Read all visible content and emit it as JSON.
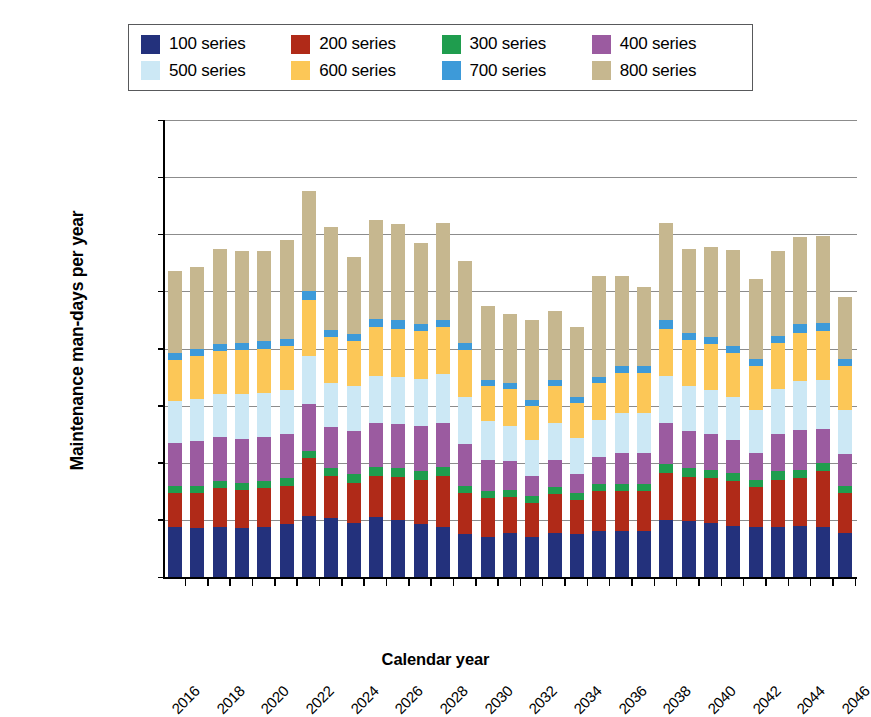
{
  "chart_data": {
    "type": "bar",
    "subtype": "stacked-vertical",
    "title": "",
    "xlabel": "Calendar year",
    "ylabel": "Maintenance man-days per year",
    "ylim": [
      0,
      1600000
    ],
    "ytick_step": 200000,
    "ytick_labels": [
      "1,600,000",
      "1,400,000",
      "1,200,000",
      "1,000,000",
      "800,000",
      "600,000",
      "400,000",
      "200,000",
      "0"
    ],
    "ytick_values": [
      1600000,
      1400000,
      1200000,
      1000000,
      800000,
      600000,
      400000,
      200000,
      0
    ],
    "grid": true,
    "legend_position": "top",
    "categories": [
      2016,
      2017,
      2018,
      2019,
      2020,
      2021,
      2022,
      2023,
      2024,
      2025,
      2026,
      2027,
      2028,
      2029,
      2030,
      2031,
      2032,
      2033,
      2034,
      2035,
      2036,
      2037,
      2038,
      2039,
      2040,
      2041,
      2042,
      2043,
      2044,
      2045,
      2046
    ],
    "xtick_labels": [
      "2016",
      "2018",
      "2020",
      "2022",
      "2024",
      "2026",
      "2028",
      "2030",
      "2032",
      "2034",
      "2036",
      "2038",
      "2040",
      "2042",
      "2044",
      "2046"
    ],
    "series": [
      {
        "name": "100 series",
        "color": "#23317c",
        "values": [
          175000,
          170000,
          175000,
          170000,
          175000,
          185000,
          215000,
          205000,
          190000,
          210000,
          200000,
          185000,
          175000,
          150000,
          140000,
          155000,
          140000,
          155000,
          150000,
          160000,
          160000,
          160000,
          200000,
          195000,
          190000,
          180000,
          175000,
          175000,
          180000,
          175000,
          155000
        ]
      },
      {
        "name": "200 series",
        "color": "#b02a18",
        "values": [
          120000,
          125000,
          135000,
          135000,
          135000,
          135000,
          200000,
          150000,
          140000,
          145000,
          150000,
          155000,
          180000,
          145000,
          135000,
          125000,
          120000,
          135000,
          120000,
          140000,
          140000,
          140000,
          165000,
          155000,
          155000,
          155000,
          140000,
          165000,
          165000,
          195000,
          140000
        ]
      },
      {
        "name": "300 series",
        "color": "#1f9d4e",
        "values": [
          25000,
          25000,
          25000,
          25000,
          25000,
          25000,
          25000,
          25000,
          30000,
          30000,
          30000,
          30000,
          30000,
          25000,
          25000,
          25000,
          25000,
          25000,
          25000,
          25000,
          25000,
          25000,
          30000,
          30000,
          30000,
          30000,
          25000,
          30000,
          30000,
          30000,
          25000
        ]
      },
      {
        "name": "400 series",
        "color": "#9b5ba0",
        "values": [
          150000,
          155000,
          155000,
          155000,
          155000,
          155000,
          165000,
          145000,
          150000,
          155000,
          155000,
          160000,
          155000,
          145000,
          110000,
          100000,
          70000,
          95000,
          65000,
          95000,
          110000,
          110000,
          145000,
          130000,
          125000,
          115000,
          95000,
          130000,
          140000,
          120000,
          110000
        ]
      },
      {
        "name": "500 series",
        "color": "#cce8f5",
        "values": [
          145000,
          150000,
          150000,
          155000,
          155000,
          155000,
          170000,
          155000,
          160000,
          165000,
          165000,
          165000,
          170000,
          165000,
          135000,
          125000,
          125000,
          130000,
          125000,
          130000,
          140000,
          140000,
          165000,
          160000,
          155000,
          150000,
          150000,
          160000,
          170000,
          170000,
          155000
        ]
      },
      {
        "name": "600 series",
        "color": "#fcc757",
        "values": [
          145000,
          150000,
          150000,
          155000,
          155000,
          155000,
          195000,
          160000,
          155000,
          170000,
          170000,
          165000,
          165000,
          165000,
          125000,
          130000,
          120000,
          130000,
          125000,
          130000,
          140000,
          140000,
          165000,
          160000,
          160000,
          155000,
          155000,
          160000,
          170000,
          170000,
          155000
        ]
      },
      {
        "name": "700 series",
        "color": "#3d9ad9",
        "values": [
          25000,
          25000,
          25000,
          25000,
          25000,
          25000,
          30000,
          25000,
          25000,
          30000,
          30000,
          25000,
          25000,
          25000,
          20000,
          20000,
          20000,
          20000,
          20000,
          20000,
          25000,
          25000,
          30000,
          25000,
          25000,
          25000,
          25000,
          25000,
          30000,
          30000,
          25000
        ]
      },
      {
        "name": "800 series",
        "color": "#c6b78f",
        "values": [
          285000,
          285000,
          335000,
          320000,
          315000,
          345000,
          350000,
          360000,
          270000,
          345000,
          335000,
          285000,
          340000,
          285000,
          260000,
          240000,
          280000,
          240000,
          245000,
          355000,
          315000,
          275000,
          340000,
          295000,
          315000,
          335000,
          280000,
          295000,
          305000,
          305000,
          215000
        ]
      }
    ]
  },
  "legend": {
    "rows": [
      [
        {
          "label": "100 series",
          "color": "#23317c"
        },
        {
          "label": "200 series",
          "color": "#b02a18"
        },
        {
          "label": "300 series",
          "color": "#1f9d4e"
        },
        {
          "label": "400 series",
          "color": "#9b5ba0"
        }
      ],
      [
        {
          "label": "500 series",
          "color": "#cce8f5"
        },
        {
          "label": "600 series",
          "color": "#fcc757"
        },
        {
          "label": "700 series",
          "color": "#3d9ad9"
        },
        {
          "label": "800 series",
          "color": "#c6b78f"
        }
      ]
    ]
  },
  "axis": {
    "y_title": "Maintenance man-days per year",
    "x_title": "Calendar year"
  }
}
